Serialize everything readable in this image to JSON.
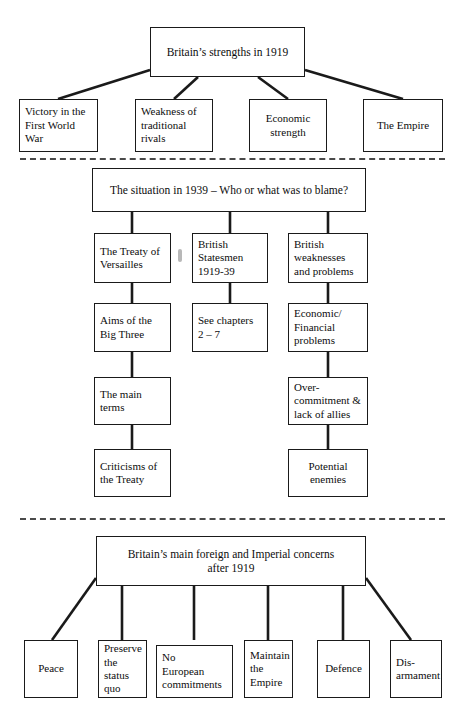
{
  "diagram": {
    "line_color": "#1a1a1a",
    "box_border_color": "#1a1a1a",
    "background_color": "#ffffff",
    "divider_color": "#4a4a4a"
  },
  "section_top": {
    "header": "Britain’s strengths in 1919",
    "children": [
      "Victory in the\nFirst World\nWar",
      "Weakness of\ntraditional\nrivals",
      "Economic\nstrength",
      "The Empire"
    ]
  },
  "section_middle": {
    "header": "The situation in 1939 – Who or what was to blame?",
    "column_1": [
      "The Treaty of\nVersailles",
      "Aims of the\nBig Three",
      "The main terms",
      "Criticisms of\nthe Treaty"
    ],
    "column_2": [
      "British\nStatesmen\n1919-39",
      "See chapters\n2 – 7"
    ],
    "column_3": [
      "British\nweaknesses\nand problems",
      "Economic/\nFinancial\nproblems",
      "Over-\ncommitment &\nlack of allies",
      "Potential\nenemies"
    ]
  },
  "section_bottom": {
    "header": "Britain’s main foreign and Imperial concerns\nafter 1919",
    "children": [
      "Peace",
      "Preserve\nthe\nstatus\nquo",
      "No\nEuropean\ncommitments",
      "Maintain\nthe\nEmpire",
      "Defence",
      "Dis-\narmament"
    ]
  }
}
